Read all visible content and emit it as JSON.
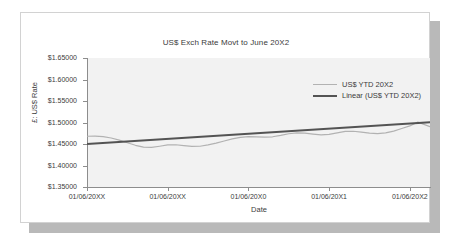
{
  "chart_data": {
    "type": "line",
    "title": "US$ Exch Rate Movt to June 20X2",
    "xlabel": "Date",
    "ylabel": "£: US$ Rate",
    "grid": false,
    "legend_position": "inside-top-right",
    "ylim": [
      1.35,
      1.65
    ],
    "ytick_labels": [
      "$1.65000",
      "$1.60000",
      "$1.55000",
      "$1.50000",
      "$1.45000",
      "$1.40000",
      "$1.35000"
    ],
    "ytick_values": [
      1.65,
      1.6,
      1.55,
      1.5,
      1.45,
      1.4,
      1.35
    ],
    "xtick_labels": [
      "01/06/20XX",
      "01/06/20XX",
      "01/06/20X0",
      "01/06/20X1",
      "01/06/20X2"
    ],
    "xtick_positions": [
      0,
      1,
      2,
      3,
      4
    ],
    "xlim": [
      0,
      4.25
    ],
    "series": [
      {
        "name": "US$ YTD 20X2",
        "color": "#b2b2b2",
        "width": 1.2,
        "x": [
          0.0,
          0.1,
          0.2,
          0.3,
          0.4,
          0.5,
          0.6,
          0.7,
          0.8,
          0.9,
          1.0,
          1.1,
          1.2,
          1.3,
          1.4,
          1.5,
          1.6,
          1.7,
          1.8,
          1.9,
          2.0,
          2.1,
          2.2,
          2.3,
          2.4,
          2.5,
          2.6,
          2.7,
          2.8,
          2.9,
          3.0,
          3.1,
          3.2,
          3.3,
          3.4,
          3.5,
          3.6,
          3.7,
          3.8,
          3.9,
          4.0,
          4.1,
          4.25
        ],
        "values": [
          1.468,
          1.4682,
          1.467,
          1.464,
          1.459,
          1.453,
          1.447,
          1.4428,
          1.442,
          1.4448,
          1.4478,
          1.4482,
          1.4462,
          1.4444,
          1.4448,
          1.4478,
          1.452,
          1.457,
          1.462,
          1.4655,
          1.4672,
          1.4668,
          1.466,
          1.4668,
          1.47,
          1.4738,
          1.4758,
          1.4752,
          1.473,
          1.4712,
          1.4722,
          1.476,
          1.4792,
          1.4796,
          1.4778,
          1.4752,
          1.474,
          1.4758,
          1.48,
          1.486,
          1.492,
          1.501,
          1.4905
        ]
      },
      {
        "name": "Linear (US$ YTD 20X2)",
        "color": "#545454",
        "width": 2.0,
        "trend": true,
        "x": [
          0.0,
          4.25
        ],
        "values": [
          1.45,
          1.5005
        ]
      }
    ]
  },
  "legend": {
    "items": [
      {
        "label": "US$ YTD 20X2"
      },
      {
        "label": "Linear (US$ YTD 20X2)"
      }
    ]
  }
}
